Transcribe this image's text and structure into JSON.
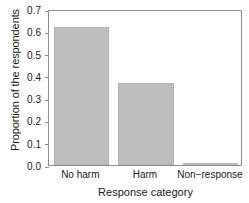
{
  "chart_data": {
    "type": "bar",
    "title": "",
    "xlabel": "Response category",
    "ylabel": "Proportion of the respondents",
    "categories": [
      "No harm",
      "Harm",
      "Non−response"
    ],
    "values": [
      0.62,
      0.37,
      0.005
    ],
    "ylim": [
      0.0,
      0.7
    ],
    "ytick_labels": [
      "0.0",
      "0.1",
      "0.2",
      "0.3",
      "0.4",
      "0.5",
      "0.6",
      "0.7"
    ],
    "ytick_values": [
      0.0,
      0.1,
      0.2,
      0.3,
      0.4,
      0.5,
      0.6,
      0.7
    ],
    "grid": false,
    "legend": null,
    "bar_color": "#bebebe",
    "bar_edge_color": "#b2b2b2",
    "frame_color": "#8c8c8c",
    "text_color": "#1a1a1a"
  }
}
